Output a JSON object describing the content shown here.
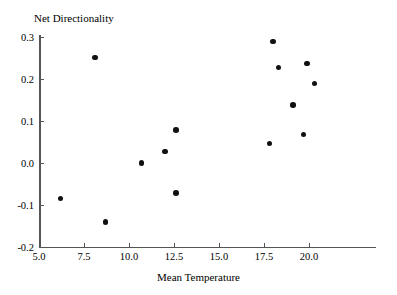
{
  "chart_data": {
    "type": "scatter",
    "title": "",
    "xlabel": "Mean Temperature",
    "ylabel": "Net Directionality",
    "xlim": [
      5.0,
      20.9
    ],
    "ylim": [
      -0.2,
      0.3
    ],
    "grid": false,
    "legend": null,
    "marker": {
      "shape": "circle",
      "color": "#111111",
      "size": 5.6
    },
    "xticks": [
      {
        "value": 5.0,
        "label": "5.0"
      },
      {
        "value": 7.5,
        "label": "7.5"
      },
      {
        "value": 10.0,
        "label": "10.0"
      },
      {
        "value": 12.5,
        "label": "12.5"
      },
      {
        "value": 15.0,
        "label": "15.0"
      },
      {
        "value": 17.5,
        "label": "17.5"
      },
      {
        "value": 20.0,
        "label": "20.0"
      }
    ],
    "yticks": [
      {
        "value": 0.3,
        "label": "0.3"
      },
      {
        "value": 0.2,
        "label": "0.2"
      },
      {
        "value": 0.1,
        "label": "0.1"
      },
      {
        "value": 0.0,
        "label": "0.0"
      },
      {
        "value": -0.1,
        "label": "-0.1"
      },
      {
        "value": -0.2,
        "label": "-0.2"
      }
    ],
    "points": [
      {
        "x": 6.2,
        "y": -0.085
      },
      {
        "x": 8.1,
        "y": 0.251
      },
      {
        "x": 8.7,
        "y": -0.14
      },
      {
        "x": 10.7,
        "y": 0.0
      },
      {
        "x": 12.0,
        "y": 0.027
      },
      {
        "x": 12.6,
        "y": 0.079
      },
      {
        "x": 12.6,
        "y": -0.072
      },
      {
        "x": 17.8,
        "y": 0.046
      },
      {
        "x": 18.0,
        "y": 0.289
      },
      {
        "x": 18.3,
        "y": 0.227
      },
      {
        "x": 19.1,
        "y": 0.138
      },
      {
        "x": 19.7,
        "y": 0.068
      },
      {
        "x": 19.9,
        "y": 0.237
      },
      {
        "x": 20.3,
        "y": 0.189
      }
    ],
    "x": [
      6.2,
      8.1,
      8.7,
      10.7,
      12.0,
      12.6,
      12.6,
      17.8,
      18.0,
      18.3,
      19.1,
      19.7,
      19.9,
      20.3
    ],
    "values": [
      -0.085,
      0.251,
      -0.14,
      0.0,
      0.027,
      0.079,
      -0.072,
      0.046,
      0.289,
      0.227,
      0.138,
      0.068,
      0.237,
      0.189
    ]
  },
  "axes": {
    "y_title": "Net Directionality",
    "x_title": "Mean Temperature"
  },
  "colors": {
    "marker": "#111111",
    "axis": "#555555",
    "background": "#ffffff"
  }
}
